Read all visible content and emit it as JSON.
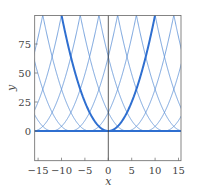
{
  "chart_data": {
    "type": "line",
    "title": "",
    "xlabel": "x",
    "ylabel": "y",
    "xlim": [
      -15.7,
      15.7
    ],
    "ylim": [
      -26,
      99
    ],
    "grid": false,
    "legend": null,
    "x_ticks": [
      -15,
      -10,
      -5,
      0,
      5,
      10,
      15
    ],
    "x_tick_labels": [
      "−15",
      "−10",
      "−5",
      "0",
      "5",
      "10",
      "15"
    ],
    "y_ticks": [
      0,
      25,
      50,
      75
    ],
    "y_tick_labels": [
      "0",
      "25",
      "50",
      "75"
    ],
    "series": [
      {
        "name": "y = (x - c)^2, c in multiples of 4",
        "formula": "(x-c)^2",
        "centers": [
          -28,
          -24,
          -20,
          -16,
          -12,
          -8,
          -4,
          4,
          8,
          12,
          16,
          20,
          24,
          28
        ],
        "style": "thin",
        "color": "#5b8fd6"
      },
      {
        "name": "y = x^2",
        "formula": "x^2",
        "centers": [
          0
        ],
        "style": "thick",
        "color": "#2f6fd0"
      },
      {
        "name": "y = 0",
        "formula": "0",
        "style": "baseline",
        "color": "#2f6fd0"
      }
    ],
    "vertical_line_x": 0
  }
}
